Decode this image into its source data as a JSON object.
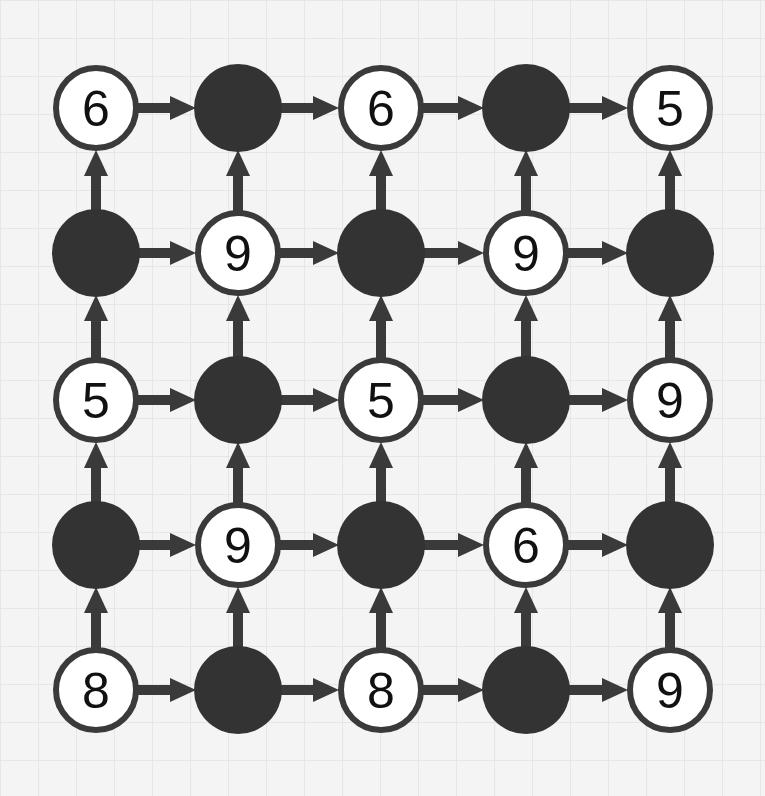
{
  "diagram": {
    "type": "grid-graph",
    "rows": 5,
    "cols": 5,
    "node_centers_x": [
      96,
      238,
      381,
      526,
      670
    ],
    "node_centers_y": [
      108,
      253,
      400,
      545,
      690
    ],
    "node_radius": 42,
    "colors": {
      "stroke": "#3a3a3a",
      "filled": "#333333",
      "empty_fill": "#ffffff",
      "arrow": "#3a3a3a",
      "text": "#111111"
    },
    "edge_rule": "arrows point right between horizontal neighbors and up between vertical neighbors",
    "nodes": [
      [
        "6",
        null,
        "6",
        null,
        "5"
      ],
      [
        null,
        "9",
        null,
        "9",
        null
      ],
      [
        "5",
        null,
        "5",
        null,
        "9"
      ],
      [
        null,
        "9",
        null,
        "6",
        null
      ],
      [
        "8",
        null,
        "8",
        null,
        "9"
      ]
    ]
  }
}
